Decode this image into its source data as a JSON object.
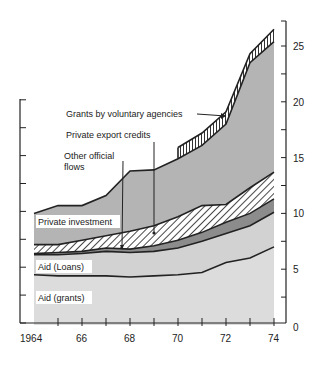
{
  "chart_data": {
    "type": "area",
    "stacked": true,
    "title": "",
    "xlabel": "",
    "ylabel": "",
    "x": [
      1964,
      1965,
      1966,
      1967,
      1968,
      1969,
      1970,
      1971,
      1972,
      1973,
      1974
    ],
    "x_tick_labels": [
      "1964",
      "",
      "66",
      "",
      "68",
      "",
      "70",
      "",
      "72",
      "",
      "74"
    ],
    "ylim": [
      0,
      27
    ],
    "y_ticks": [
      0,
      5,
      10,
      15,
      20,
      25
    ],
    "y_tick_labels": [
      "0",
      "5",
      "10",
      "15",
      "20",
      "25"
    ],
    "y_axis_position": "right",
    "grid": false,
    "legend": "inline labels",
    "series_cumulative_top": [
      {
        "name": "Aid (grants)",
        "values": [
          4.5,
          4.4,
          4.4,
          4.4,
          4.3,
          4.4,
          4.5,
          4.7,
          5.6,
          6.0,
          7.0
        ]
      },
      {
        "name": "Aid (Loans)",
        "values": [
          6.3,
          6.3,
          6.4,
          6.6,
          6.5,
          6.6,
          6.9,
          7.5,
          8.2,
          8.9,
          10.1
        ]
      },
      {
        "name": "Other official flows",
        "values": [
          6.4,
          6.5,
          6.6,
          6.9,
          6.8,
          7.1,
          7.6,
          8.3,
          9.2,
          10.0,
          11.3
        ]
      },
      {
        "name": "Private export credits",
        "values": [
          7.2,
          7.2,
          7.6,
          8.0,
          8.4,
          8.9,
          9.7,
          10.7,
          10.8,
          12.3,
          13.7
        ]
      },
      {
        "name": "Private investment",
        "values": [
          10.0,
          10.7,
          10.7,
          11.6,
          13.8,
          13.9,
          14.9,
          16.1,
          18.0,
          23.5,
          25.4
        ]
      },
      {
        "name": "Grants by voluntary agencies",
        "values": [
          null,
          null,
          null,
          null,
          null,
          null,
          15.9,
          17.2,
          19.1,
          24.3,
          26.5
        ]
      }
    ],
    "annotations": [
      {
        "text": "Grants by voluntary agencies",
        "arrow_to": "voluntary band 1972"
      },
      {
        "text": "Private export credits",
        "arrow_to": "hatched band 1969"
      },
      {
        "text": "Other official flows",
        "arrow_to": "dark band 1968"
      },
      {
        "text": "Private investment"
      },
      {
        "text": "Aid (Loans)"
      },
      {
        "text": "Aid (grants)"
      }
    ]
  },
  "labels": {
    "voluntary": "Grants by voluntary agencies",
    "export": "Private export credits",
    "other_line1": "Other official",
    "other_line2": "flows",
    "private_investment": "Private investment",
    "aid_loans": "Aid (Loans)",
    "aid_grants": "Aid (grants)"
  },
  "colors": {
    "grants": "#dcdcdc",
    "loans": "#d2d2d2",
    "other": "#8c8c8c",
    "export_bg": "#ffffff",
    "investment": "#b4b4b4",
    "voluntary_bg": "#ffffff",
    "line": "#222222"
  }
}
